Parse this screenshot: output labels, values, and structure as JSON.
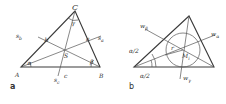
{
  "figure_a": {
    "panel_label": "a",
    "vertices": {
      "A": "A",
      "B": "B",
      "C": "C"
    },
    "sides": {
      "a": "a",
      "b": "b",
      "c": "c"
    },
    "angles": {
      "alpha": "α",
      "beta": "β",
      "gamma": "γ"
    },
    "medians": {
      "s_a": "s",
      "s_a_sub": "a",
      "s_b": "s",
      "s_b_sub": "b",
      "s_c": "s",
      "s_c_sub": "c"
    },
    "centroid": "S"
  },
  "figure_b": {
    "panel_label": "b",
    "bisectors": {
      "w_alpha": "w",
      "w_alpha_sub": "α",
      "w_beta": "w",
      "w_beta_sub": "β",
      "w_gamma": "w",
      "w_gamma_sub": "γ"
    },
    "half_angle_upper": "α/2",
    "half_angle_lower": "α/2",
    "radius": "r",
    "incenter": "M",
    "incenter_sub": "i"
  }
}
